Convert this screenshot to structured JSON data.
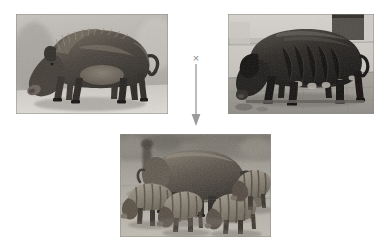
{
  "figure": {
    "type": "crossbreeding-diagram",
    "background_color": "#ffffff",
    "width": 389,
    "height": 251,
    "cross_symbol": "×",
    "cross_symbol_color": "#8a8a8a",
    "arrow_color": "#9a9a9a",
    "arrow_direction": "down",
    "caption": "",
    "panels": [
      {
        "id": "parent-left",
        "role": "parent",
        "label": "",
        "alt": "Grayscale photograph of a bristly dark-haired pig standing in left profile with its snout lowered to the ground against a pale wall",
        "subject": "bristly wild-type boar",
        "orientation": "facing left",
        "palette": {
          "background": "#b9b6b0",
          "ground": "#cfccc6",
          "animal_dark": "#3a3631",
          "animal_mid": "#5c564e",
          "animal_light": "#7d756a"
        }
      },
      {
        "id": "parent-right",
        "role": "parent",
        "label": "",
        "alt": "Grayscale photograph of a heavy black domestic pig standing in left profile on a paved yard, head lowered",
        "subject": "black domestic pig",
        "orientation": "facing left",
        "palette": {
          "background": "#c4c1bb",
          "ground": "#9d9a94",
          "animal_dark": "#1d1b19",
          "animal_mid": "#322f2b",
          "animal_light": "#4e4a44"
        }
      },
      {
        "id": "offspring",
        "role": "offspring",
        "label": "",
        "alt": "Grayscale photograph of a sow grazing outdoors surrounded by several striped piglets on bare earth",
        "subject": "sow with striped hybrid piglets",
        "orientation": "facing right",
        "palette": {
          "background": "#a8a49c",
          "ground": "#b6b2a9",
          "animal_dark": "#35312c",
          "animal_mid": "#5a544c",
          "animal_light": "#8d867b"
        }
      }
    ]
  }
}
